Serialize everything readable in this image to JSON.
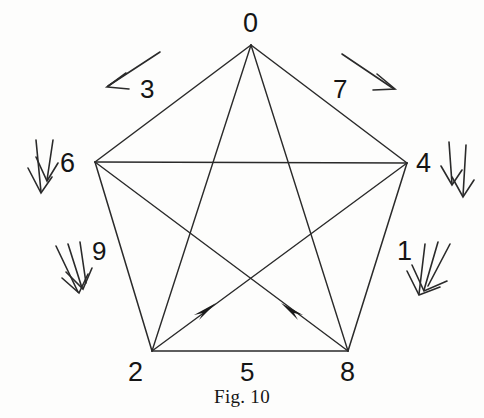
{
  "figure": {
    "caption": "Fig. 10",
    "stroke_color": "#2a2a2a",
    "text_color": "#151515",
    "background_color": "#fdfdfc",
    "shape": "pentagon-with-inscribed-pentagram",
    "vertices": [
      {
        "label": "0",
        "position": "top",
        "x": 251,
        "y": 45,
        "label_x": 243,
        "label_y": 10
      },
      {
        "label": "4",
        "position": "right",
        "x": 407,
        "y": 163,
        "label_x": 416,
        "label_y": 150
      },
      {
        "label": "8",
        "position": "bottom-right",
        "x": 348,
        "y": 351,
        "label_x": 340,
        "label_y": 359
      },
      {
        "label": "2",
        "position": "bottom-left",
        "x": 152,
        "y": 351,
        "label_x": 128,
        "label_y": 359
      },
      {
        "label": "6",
        "position": "left",
        "x": 95,
        "y": 162,
        "label_x": 60,
        "label_y": 150
      }
    ],
    "pentagon_edges": [
      {
        "from": "0",
        "to": "4",
        "label": "7"
      },
      {
        "from": "4",
        "to": "8",
        "label": "1"
      },
      {
        "from": "8",
        "to": "2",
        "label": "5"
      },
      {
        "from": "2",
        "to": "6",
        "label": "9"
      },
      {
        "from": "6",
        "to": "0",
        "label": "3"
      }
    ],
    "diagonals": [
      {
        "from": "0",
        "to": "8",
        "arrow": false
      },
      {
        "from": "0",
        "to": "2",
        "arrow": false
      },
      {
        "from": "6",
        "to": "4",
        "arrow": false
      },
      {
        "from": "2",
        "to": "4",
        "arrow": true,
        "arrow_direction": "up-right"
      },
      {
        "from": "8",
        "to": "6",
        "arrow": true,
        "arrow_direction": "up-left"
      }
    ],
    "edge_labels": [
      {
        "text": "3",
        "x": 140,
        "y": 76,
        "style": "normal"
      },
      {
        "text": "7",
        "x": 333,
        "y": 76,
        "style": "normal"
      },
      {
        "text": "9",
        "x": 92,
        "y": 238,
        "style": "normal"
      },
      {
        "text": "1",
        "x": 395,
        "y": 238,
        "style": "thin-one"
      },
      {
        "text": "5",
        "x": 240,
        "y": 359,
        "style": "normal"
      },
      {
        "text": "2",
        "x": 128,
        "y": 359,
        "style": "normal"
      },
      {
        "text": "8",
        "x": 340,
        "y": 359,
        "style": "normal"
      }
    ],
    "annotation_arrows": [
      {
        "name": "single-arrow-top-left",
        "multiplicity": 1,
        "direction": "down-left",
        "near_label": "3"
      },
      {
        "name": "single-arrow-top-right",
        "multiplicity": 1,
        "direction": "down-right",
        "near_label": "7"
      },
      {
        "name": "double-arrow-left",
        "multiplicity": 2,
        "direction": "down",
        "near_label": "6"
      },
      {
        "name": "double-arrow-right",
        "multiplicity": 2,
        "direction": "down",
        "near_label": "4"
      },
      {
        "name": "triple-arrow-lower-left",
        "multiplicity": 3,
        "direction": "down",
        "near_label": "9"
      },
      {
        "name": "triple-arrow-lower-right",
        "multiplicity": 3,
        "direction": "down-left",
        "near_label": "1"
      }
    ]
  }
}
